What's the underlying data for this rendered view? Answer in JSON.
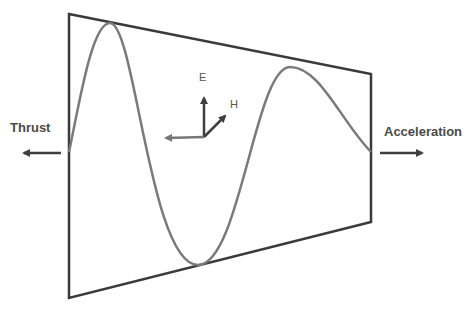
{
  "diagram": {
    "labels": {
      "left": "Thrust",
      "right": "Acceleration",
      "axis_up": "E",
      "axis_diag": "H"
    },
    "colors": {
      "frame": "#3a3a3a",
      "wave": "#7a7a7a",
      "arrows": "#3f3f3f",
      "text": "#4a4a4a"
    },
    "shape": {
      "type": "trapezoid",
      "corners": [
        [
          69,
          14
        ],
        [
          371,
          74
        ],
        [
          371,
          222
        ],
        [
          69,
          298
        ]
      ]
    },
    "wave": {
      "start": [
        69,
        152
      ],
      "end": [
        371,
        152
      ],
      "extrema": [
        [
          110,
          23
        ],
        [
          198,
          265
        ],
        [
          290,
          67
        ]
      ]
    }
  }
}
